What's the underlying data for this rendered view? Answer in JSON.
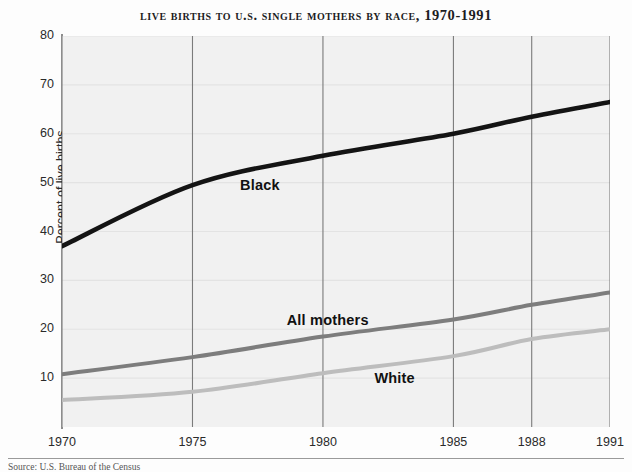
{
  "chart_data": {
    "type": "line",
    "title": "Live Births to U.S. Single Mothers by Race, 1970-1991",
    "xlabel": "",
    "ylabel": "Percent of live births",
    "x": [
      1970,
      1975,
      1980,
      1985,
      1988,
      1991
    ],
    "xtick_labels": [
      "1970",
      "1975",
      "1980",
      "1985",
      "1988",
      "1991"
    ],
    "ytick_labels": [
      "10",
      "20",
      "30",
      "40",
      "50",
      "60",
      "70",
      "80"
    ],
    "ytick_values": [
      10,
      20,
      30,
      40,
      50,
      60,
      70,
      80
    ],
    "xlim": [
      1970,
      1991
    ],
    "ylim": [
      0,
      80
    ],
    "grid": "vertical gridlines at each x tick; faint horizontal gridlines at each y tick",
    "legend": "inline labels placed next to each line",
    "series": [
      {
        "name": "Black",
        "color": "#141414",
        "values": [
          37.0,
          49.5,
          55.5,
          60.0,
          63.5,
          66.5
        ],
        "label_x_pct": 32.5,
        "label_y_pct": 36.0
      },
      {
        "name": "All mothers",
        "color": "#7d7d7d",
        "values": [
          10.8,
          14.3,
          18.5,
          22.0,
          25.0,
          27.5
        ],
        "label_x_pct": 41.0,
        "label_y_pct": 70.5
      },
      {
        "name": "White",
        "color": "#bdbdbd",
        "values": [
          5.5,
          7.2,
          11.0,
          14.5,
          18.0,
          20.0
        ],
        "label_x_pct": 57.0,
        "label_y_pct": 85.5
      }
    ]
  },
  "source": {
    "text": "Source: U.S. Bureau of the Census"
  }
}
